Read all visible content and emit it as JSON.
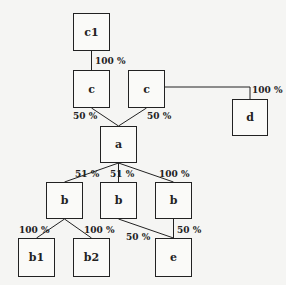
{
  "diagram": {
    "type": "ownership-tree",
    "nodes": {
      "c1": "c1",
      "c_left": "c",
      "c_right": "c",
      "d": "d",
      "a": "a",
      "b_left": "b",
      "b_mid": "b",
      "b_right": "b",
      "b1": "b1",
      "b2": "b2",
      "e": "e"
    },
    "edges": {
      "c1_to_c_left": "100 %",
      "c_right_to_d": "100 %",
      "c_left_to_a": "50 %",
      "c_right_to_a": "50 %",
      "a_to_b_left": "51 %",
      "a_to_b_mid": "51 %",
      "a_to_b_right": "100 %",
      "b_left_to_b1": "100 %",
      "b_left_to_b2": "100 %",
      "b_mid_to_e": "50 %",
      "b_right_to_e": "50 %"
    }
  }
}
